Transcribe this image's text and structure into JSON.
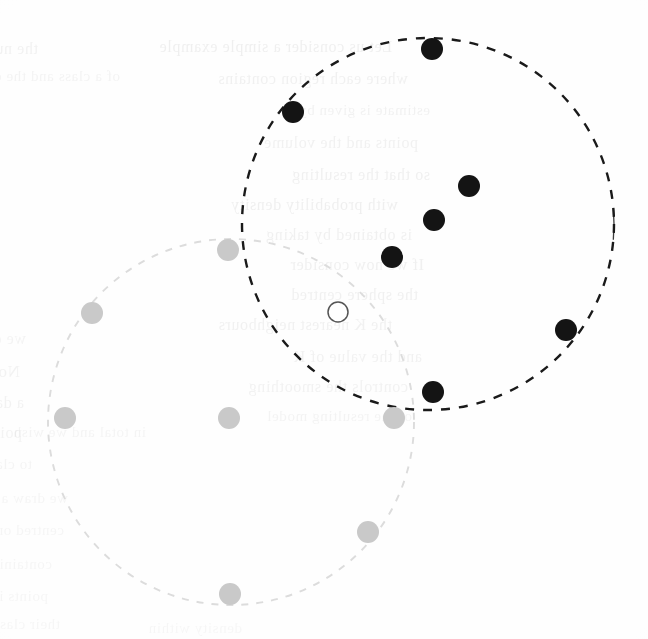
{
  "figure": {
    "caption": "",
    "background_color": "#fefefe",
    "width": 648,
    "height": 639
  },
  "palette": {
    "dark_stroke": "#1a1a1a",
    "dark_fill": "#141414",
    "light_stroke": "#dcdcdc",
    "light_fill": "#c9c9c9",
    "hollow_stroke": "#555555",
    "hollow_fill": "#ffffff",
    "bleed_text": "#cfcfcf",
    "page_background": "#fefefe"
  },
  "chart_data": {
    "type": "scatter",
    "title": "",
    "subtitle": "",
    "xlabel": "",
    "ylabel": "",
    "xlim": [
      0,
      648
    ],
    "ylim": [
      0,
      639
    ],
    "grid": false,
    "legend": "none",
    "axes_visible": false,
    "note": "Two overlapping dashed circular region boundaries enclosing two classes of points plus one unlabeled query point.",
    "regions": [
      {
        "name": "dark-cluster-boundary",
        "shape": "circle",
        "cx": 428,
        "cy": 224,
        "r": 186,
        "stroke": "#1a1a1a",
        "stroke_width": 2.4,
        "dash": "9 9",
        "fill": "none"
      },
      {
        "name": "light-cluster-boundary",
        "shape": "circle",
        "cx": 231,
        "cy": 422,
        "r": 183,
        "stroke": "#dcdcdc",
        "stroke_width": 1.9,
        "dash": "7 8",
        "fill": "none"
      }
    ],
    "series": [
      {
        "name": "dark-class-points",
        "marker": "filled-circle",
        "color": "#141414",
        "radius": 11,
        "count": 7,
        "points": [
          {
            "x": 432,
            "y": 49
          },
          {
            "x": 293,
            "y": 112
          },
          {
            "x": 469,
            "y": 186
          },
          {
            "x": 434,
            "y": 220
          },
          {
            "x": 392,
            "y": 257
          },
          {
            "x": 566,
            "y": 330
          },
          {
            "x": 433,
            "y": 392
          }
        ]
      },
      {
        "name": "light-class-points",
        "marker": "filled-circle",
        "color": "#c9c9c9",
        "radius": 11,
        "count": 7,
        "points": [
          {
            "x": 228,
            "y": 250
          },
          {
            "x": 92,
            "y": 313
          },
          {
            "x": 65,
            "y": 418
          },
          {
            "x": 229,
            "y": 418
          },
          {
            "x": 394,
            "y": 418
          },
          {
            "x": 368,
            "y": 532
          },
          {
            "x": 230,
            "y": 594
          }
        ]
      },
      {
        "name": "query-point",
        "marker": "hollow-circle",
        "color": "#ffffff",
        "stroke": "#555555",
        "radius": 10,
        "count": 1,
        "points": [
          {
            "x": 338,
            "y": 312
          }
        ]
      }
    ]
  },
  "bleed_through": {
    "description": "Faint mirrored text showing through from the reverse side of the scanned page.",
    "lines": [
      {
        "text": "the number of points in the region",
        "x": 38,
        "y": 40,
        "size": 16,
        "opacity": 0.26
      },
      {
        "text": "Let us consider a simple example",
        "x": 392,
        "y": 38,
        "size": 16,
        "opacity": 0.3
      },
      {
        "text": "of a class and the density",
        "x": 120,
        "y": 68,
        "size": 15,
        "opacity": 0.22
      },
      {
        "text": "where each region contains",
        "x": 408,
        "y": 70,
        "size": 16,
        "opacity": 0.28
      },
      {
        "text": "estimate is given by",
        "x": 430,
        "y": 102,
        "size": 15,
        "opacity": 0.26
      },
      {
        "text": "points and the volume",
        "x": 418,
        "y": 134,
        "size": 16,
        "opacity": 0.27
      },
      {
        "text": "so that the resulting",
        "x": 430,
        "y": 166,
        "size": 16,
        "opacity": 0.29
      },
      {
        "text": "with probability density",
        "x": 398,
        "y": 196,
        "size": 16,
        "opacity": 0.3
      },
      {
        "text": "is obtained by taking",
        "x": 412,
        "y": 226,
        "size": 16,
        "opacity": 0.28
      },
      {
        "text": "If we now consider",
        "x": 424,
        "y": 256,
        "size": 16,
        "opacity": 0.29
      },
      {
        "text": "the sphere centred",
        "x": 418,
        "y": 286,
        "size": 16,
        "opacity": 0.28
      },
      {
        "text": "the K nearest neighbours",
        "x": 392,
        "y": 316,
        "size": 16,
        "opacity": 0.27
      },
      {
        "text": "and the value of K",
        "x": 422,
        "y": 348,
        "size": 16,
        "opacity": 0.26
      },
      {
        "text": "controls the smoothing",
        "x": 408,
        "y": 378,
        "size": 16,
        "opacity": 0.25
      },
      {
        "text": "of the resulting model",
        "x": 412,
        "y": 408,
        "size": 15,
        "opacity": 0.22
      },
      {
        "text": "we obtain the classifier",
        "x": 26,
        "y": 330,
        "size": 16,
        "opacity": 0.22
      },
      {
        "text": "Now suppose we have",
        "x": 20,
        "y": 362,
        "size": 17,
        "opacity": 0.24
      },
      {
        "text": "a data set comprising",
        "x": 24,
        "y": 394,
        "size": 16,
        "opacity": 0.23
      },
      {
        "text": "points of class one",
        "x": 22,
        "y": 424,
        "size": 16,
        "opacity": 0.22
      },
      {
        "text": "in total and we wish",
        "x": 146,
        "y": 424,
        "size": 15,
        "opacity": 0.2
      },
      {
        "text": "to classify a new point",
        "x": 32,
        "y": 456,
        "size": 15,
        "opacity": 0.2
      },
      {
        "text": "we draw a sphere",
        "x": 68,
        "y": 490,
        "size": 15,
        "opacity": 0.18
      },
      {
        "text": "centred on that point",
        "x": 64,
        "y": 522,
        "size": 15,
        "opacity": 0.18
      },
      {
        "text": "containing precisely K",
        "x": 52,
        "y": 556,
        "size": 15,
        "opacity": 0.17
      },
      {
        "text": "points irrespective of",
        "x": 48,
        "y": 588,
        "size": 15,
        "opacity": 0.17
      },
      {
        "text": "their class label",
        "x": 60,
        "y": 616,
        "size": 15,
        "opacity": 0.16
      },
      {
        "text": "density within",
        "x": 242,
        "y": 620,
        "size": 15,
        "opacity": 0.15
      }
    ]
  }
}
